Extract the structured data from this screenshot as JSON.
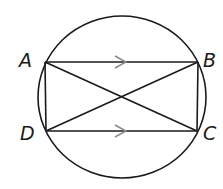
{
  "diagram": {
    "type": "inscribed-rectangle-in-circle",
    "colors": {
      "stroke": "#1a1a1a",
      "parallel_marks": "#8a8a8a",
      "background": "#ffffff"
    },
    "circle": {
      "cx": 122,
      "cy": 97,
      "rx": 84,
      "ry": 81
    },
    "points": {
      "A": {
        "label": "A",
        "x": 45,
        "y": 62
      },
      "B": {
        "label": "B",
        "x": 198,
        "y": 62
      },
      "C": {
        "label": "C",
        "x": 197,
        "y": 131
      },
      "D": {
        "label": "D",
        "x": 46,
        "y": 131
      }
    },
    "segments": [
      "AB",
      "BC",
      "CD",
      "DA",
      "AC",
      "BD"
    ],
    "parallel_marks": [
      {
        "segment": "AB",
        "x": 122,
        "y": 62,
        "direction": "right"
      },
      {
        "segment": "DC",
        "x": 122,
        "y": 131,
        "direction": "right"
      }
    ],
    "labels": {
      "A": "A",
      "B": "B",
      "C": "C",
      "D": "D"
    }
  }
}
